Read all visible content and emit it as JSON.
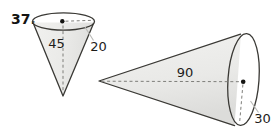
{
  "problem": {
    "number": "37."
  },
  "figures": {
    "left_cone": {
      "height_label": "45",
      "radius_label": "20"
    },
    "right_cone": {
      "axis_label": "90",
      "radius_label": "30"
    }
  },
  "colors": {
    "background": "#ffffff",
    "cone_fill": "#e9e9e7",
    "cone_fill_dark": "#dcdcda",
    "outline": "#3a3935",
    "dashed_line": "#7e7e7a",
    "leader_line": "#b8b8b5",
    "dot": "#151513",
    "text": "#1d1c1a"
  }
}
